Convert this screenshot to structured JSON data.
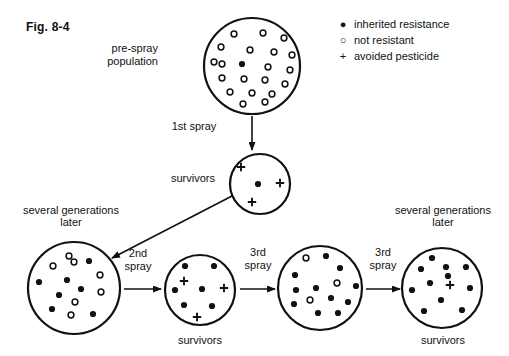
{
  "figure": {
    "number": "Fig. 8-4",
    "background": "#ffffff",
    "ink": "#111111"
  },
  "legend": {
    "items": [
      {
        "symbol": "filled-dot",
        "glyph": "●",
        "label": "inherited resistance"
      },
      {
        "symbol": "open-circle",
        "glyph": "○",
        "label": "not resistant"
      },
      {
        "symbol": "plus",
        "glyph": "+",
        "label": "avoided pesticide"
      }
    ]
  },
  "captions": {
    "pre_spray": "pre-spray\npopulation",
    "pre_spray_line1": "pre-spray",
    "pre_spray_line2": "population",
    "first_spray": "1st spray",
    "survivors_top": "survivors",
    "several_generations_left_line1": "several generations",
    "several_generations_left_line2": "later",
    "second_spray_line1": "2nd",
    "second_spray_line2": "spray",
    "third_spray_a_line1": "3rd",
    "third_spray_a_line2": "spray",
    "third_spray_b_line1": "3rd",
    "third_spray_b_line2": "spray",
    "survivors_mid": "survivors",
    "survivors_right": "survivors",
    "several_generations_right_line1": "several generations",
    "several_generations_right_line2": "later"
  },
  "chart_data": {
    "type": "diagram",
    "title": "Fig. 8-4",
    "populations": [
      {
        "id": "pre-spray-population",
        "label": "pre-spray population",
        "cx": 252,
        "cy": 66,
        "r": 48,
        "counts": {
          "resistant": 1,
          "not_resistant": 20,
          "avoided": 0
        },
        "organisms": [
          {
            "t": "o",
            "x": 234,
            "y": 34
          },
          {
            "t": "o",
            "x": 263,
            "y": 33
          },
          {
            "t": "o",
            "x": 284,
            "y": 38
          },
          {
            "t": "o",
            "x": 221,
            "y": 47
          },
          {
            "t": "o",
            "x": 250,
            "y": 50
          },
          {
            "t": "o",
            "x": 274,
            "y": 52
          },
          {
            "t": "o",
            "x": 292,
            "y": 55
          },
          {
            "t": "o",
            "x": 214,
            "y": 62
          },
          {
            "t": "d",
            "x": 242,
            "y": 64
          },
          {
            "t": "o",
            "x": 268,
            "y": 67
          },
          {
            "t": "o",
            "x": 290,
            "y": 70
          },
          {
            "t": "o",
            "x": 222,
            "y": 78
          },
          {
            "t": "o",
            "x": 244,
            "y": 79
          },
          {
            "t": "o",
            "x": 265,
            "y": 80
          },
          {
            "t": "o",
            "x": 285,
            "y": 84
          },
          {
            "t": "o",
            "x": 230,
            "y": 92
          },
          {
            "t": "o",
            "x": 252,
            "y": 93
          },
          {
            "t": "o",
            "x": 272,
            "y": 94
          },
          {
            "t": "o",
            "x": 243,
            "y": 104
          },
          {
            "t": "o",
            "x": 265,
            "y": 102
          },
          {
            "t": "o",
            "x": 222,
            "y": 64
          }
        ]
      },
      {
        "id": "survivors-first-spray",
        "label": "survivors",
        "cx": 260,
        "cy": 184,
        "r": 30,
        "counts": {
          "resistant": 1,
          "not_resistant": 0,
          "avoided": 3
        },
        "organisms": [
          {
            "t": "p",
            "x": 241,
            "y": 167
          },
          {
            "t": "d",
            "x": 258,
            "y": 184
          },
          {
            "t": "p",
            "x": 280,
            "y": 183
          },
          {
            "t": "p",
            "x": 252,
            "y": 202
          }
        ]
      },
      {
        "id": "several-generations-later-left",
        "label": "several generations later",
        "cx": 74,
        "cy": 288,
        "r": 46,
        "counts": {
          "resistant": 7,
          "not_resistant": 7,
          "avoided": 0
        },
        "organisms": [
          {
            "t": "o",
            "x": 69,
            "y": 256
          },
          {
            "t": "o",
            "x": 53,
            "y": 266
          },
          {
            "t": "o",
            "x": 74,
            "y": 262
          },
          {
            "t": "d",
            "x": 89,
            "y": 261
          },
          {
            "t": "o",
            "x": 100,
            "y": 275
          },
          {
            "t": "d",
            "x": 39,
            "y": 282
          },
          {
            "t": "d",
            "x": 67,
            "y": 280
          },
          {
            "t": "d",
            "x": 81,
            "y": 289
          },
          {
            "t": "o",
            "x": 101,
            "y": 292
          },
          {
            "t": "o",
            "x": 75,
            "y": 302
          },
          {
            "t": "d",
            "x": 52,
            "y": 309
          },
          {
            "t": "o",
            "x": 71,
            "y": 315
          },
          {
            "t": "d",
            "x": 93,
            "y": 314
          },
          {
            "t": "d",
            "x": 59,
            "y": 295
          }
        ]
      },
      {
        "id": "survivors-second-spray",
        "label": "survivors",
        "cx": 200,
        "cy": 290,
        "r": 35,
        "counts": {
          "resistant": 7,
          "not_resistant": 0,
          "avoided": 2
        },
        "organisms": [
          {
            "t": "d",
            "x": 185,
            "y": 266
          },
          {
            "t": "d",
            "x": 214,
            "y": 266
          },
          {
            "t": "p",
            "x": 184,
            "y": 281
          },
          {
            "t": "d",
            "x": 175,
            "y": 290
          },
          {
            "t": "d",
            "x": 202,
            "y": 289
          },
          {
            "t": "p",
            "x": 224,
            "y": 288
          },
          {
            "t": "d",
            "x": 184,
            "y": 305
          },
          {
            "t": "d",
            "x": 212,
            "y": 306
          },
          {
            "t": "p",
            "x": 197,
            "y": 317
          }
        ]
      },
      {
        "id": "several-generations-later-middle",
        "label": "population after 3rd spray",
        "cx": 320,
        "cy": 288,
        "r": 42,
        "counts": {
          "resistant": 11,
          "not_resistant": 3,
          "avoided": 0
        },
        "organisms": [
          {
            "t": "o",
            "x": 306,
            "y": 258
          },
          {
            "t": "d",
            "x": 326,
            "y": 256
          },
          {
            "t": "d",
            "x": 295,
            "y": 275
          },
          {
            "t": "d",
            "x": 340,
            "y": 268
          },
          {
            "t": "d",
            "x": 296,
            "y": 290
          },
          {
            "t": "o",
            "x": 337,
            "y": 283
          },
          {
            "t": "d",
            "x": 316,
            "y": 288
          },
          {
            "t": "d",
            "x": 356,
            "y": 286
          },
          {
            "t": "o",
            "x": 310,
            "y": 300
          },
          {
            "t": "d",
            "x": 331,
            "y": 298
          },
          {
            "t": "d",
            "x": 294,
            "y": 304
          },
          {
            "t": "d",
            "x": 348,
            "y": 302
          },
          {
            "t": "d",
            "x": 318,
            "y": 313
          },
          {
            "t": "d",
            "x": 338,
            "y": 313
          }
        ]
      },
      {
        "id": "survivors-third-spray-right",
        "label": "survivors",
        "cx": 442,
        "cy": 288,
        "r": 40,
        "counts": {
          "resistant": 11,
          "not_resistant": 0,
          "avoided": 1
        },
        "organisms": [
          {
            "t": "d",
            "x": 432,
            "y": 258
          },
          {
            "t": "d",
            "x": 421,
            "y": 269
          },
          {
            "t": "d",
            "x": 446,
            "y": 267
          },
          {
            "t": "d",
            "x": 466,
            "y": 267
          },
          {
            "t": "d",
            "x": 430,
            "y": 283
          },
          {
            "t": "p",
            "x": 450,
            "y": 285
          },
          {
            "t": "d",
            "x": 412,
            "y": 290
          },
          {
            "t": "d",
            "x": 470,
            "y": 288
          },
          {
            "t": "d",
            "x": 441,
            "y": 300
          },
          {
            "t": "d",
            "x": 424,
            "y": 311
          },
          {
            "t": "d",
            "x": 462,
            "y": 310
          },
          {
            "t": "d",
            "x": 448,
            "y": 276
          }
        ]
      }
    ],
    "arrows": [
      {
        "id": "arrow-first-spray",
        "label": "1st spray",
        "from": "pre-spray-population",
        "to": "survivors-first-spray",
        "kind": "vertical"
      },
      {
        "id": "arrow-second-spray",
        "label": "2nd spray",
        "from": "survivors-first-spray",
        "to": "several-generations-later-left",
        "kind": "diagonal"
      },
      {
        "id": "arrow-third-spray-a",
        "label": "3rd spray",
        "from": "several-generations-later-left",
        "to": "survivors-second-spray",
        "kind": "horizontal"
      },
      {
        "id": "arrow-to-middle",
        "label": "",
        "from": "survivors-second-spray",
        "to": "several-generations-later-middle",
        "kind": "horizontal"
      },
      {
        "id": "arrow-third-spray-b",
        "label": "3rd spray",
        "from": "several-generations-later-middle",
        "to": "survivors-third-spray-right",
        "kind": "horizontal"
      }
    ]
  }
}
